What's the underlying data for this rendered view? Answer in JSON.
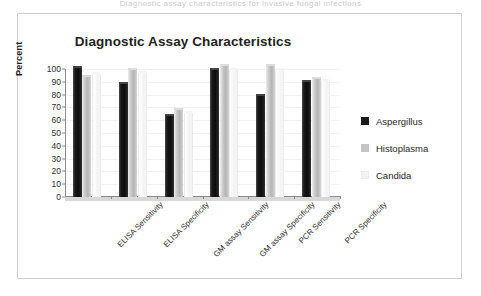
{
  "top_clip_text": "Diagnostic assay characteristics for invasive fungal infections",
  "chart_data": {
    "type": "bar",
    "title": "Diagnostic Assay Characteristics",
    "xlabel": "",
    "ylabel": "Percent",
    "ylim": [
      0,
      100
    ],
    "ytick_step": 10,
    "yticks": [
      100,
      90,
      80,
      70,
      60,
      50,
      40,
      30,
      20,
      10,
      0
    ],
    "grid": true,
    "legend_position": "right",
    "categories": [
      "ELISA Sensitivity",
      "ELISA Specificity",
      "GM assay Sensitivity",
      "GM assay Specificity",
      "PCR Sensitivity",
      "PCR Specificity"
    ],
    "series": [
      {
        "name": "Aspergillus",
        "color": "#1a1a1a",
        "values": [
          101,
          88,
          63,
          99,
          79,
          90
        ]
      },
      {
        "name": "Histoplasma",
        "color": "#c4c4c4",
        "values": [
          94,
          99,
          68,
          102,
          102,
          92
        ]
      },
      {
        "name": "Candida",
        "color": "#f4f4f4",
        "values": [
          96,
          97,
          66,
          99,
          99,
          91
        ]
      }
    ]
  }
}
